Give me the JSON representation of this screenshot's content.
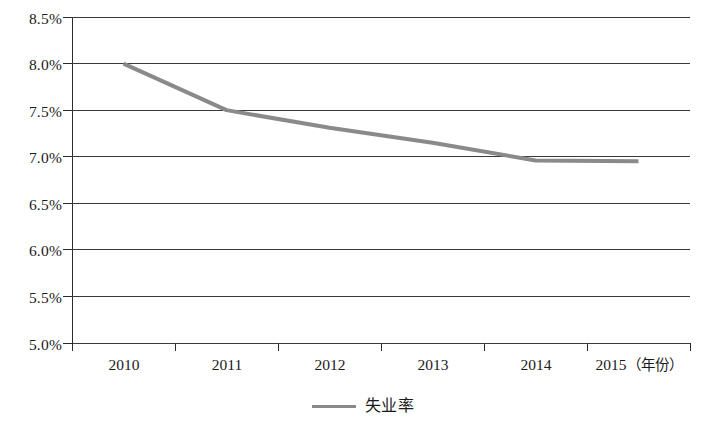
{
  "chart_data": {
    "type": "line",
    "title": "",
    "subtitle": "",
    "xlabel": "（年份）",
    "ylabel": "",
    "categories": [
      "2010",
      "2011",
      "2012",
      "2013",
      "2014",
      "2015"
    ],
    "series": [
      {
        "name": "失业率",
        "values": [
          8.0,
          7.5,
          7.31,
          7.15,
          6.96,
          6.95
        ],
        "color": "#8a8a8a"
      }
    ],
    "ylim": [
      5.0,
      8.5
    ],
    "y_ticks": [
      "5.0%",
      "5.5%",
      "6.0%",
      "6.5%",
      "7.0%",
      "7.5%",
      "8.0%",
      "8.5%"
    ],
    "y_tick_values": [
      5.0,
      5.5,
      6.0,
      6.5,
      7.0,
      7.5,
      8.0,
      8.5
    ],
    "grid": true,
    "legend_position": "bottom-center",
    "legend_entries": [
      "失业率"
    ]
  },
  "axis": {
    "unit_label": "（年份）"
  },
  "legend": {
    "marker_name": "line-swatch",
    "label": "失业率"
  },
  "colors": {
    "series_line": "#8a8a8a",
    "gridline": "#3a3a3a",
    "axis": "#2b2b2b",
    "text": "#1a1a1a",
    "background": "#ffffff"
  }
}
